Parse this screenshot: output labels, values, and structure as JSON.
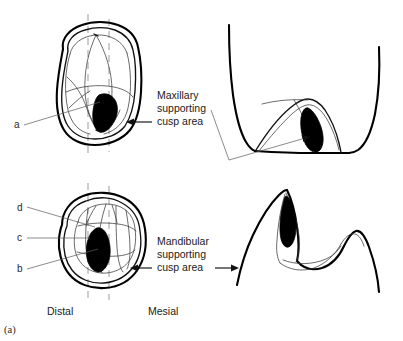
{
  "figure": {
    "caption": "(a)",
    "background_color": "#ffffff",
    "ink_color": "#000000"
  },
  "annotations": {
    "maxillary": {
      "line1": "Maxillary",
      "line2": "supporting",
      "line3": "cusp area"
    },
    "mandibular": {
      "line1": "Mandibular",
      "line2": "supporting",
      "line3": "cusp area"
    }
  },
  "orientation": {
    "left": "Distal",
    "right": "Mesial"
  },
  "callouts": [
    {
      "id": "a",
      "label": "a",
      "target": "maxillary-occlusal-cusp"
    },
    {
      "id": "d",
      "label": "d",
      "target": "mandibular-occlusal-ridge-outer"
    },
    {
      "id": "c",
      "label": "c",
      "target": "mandibular-occlusal-ridge-inner"
    },
    {
      "id": "b",
      "label": "b",
      "target": "mandibular-occlusal-cusp"
    }
  ],
  "panels": [
    {
      "id": "maxillary-occlusal",
      "name": "Maxillary occlusal view"
    },
    {
      "id": "maxillary-section",
      "name": "Maxillary cross-section view"
    },
    {
      "id": "mandibular-occlusal",
      "name": "Mandibular occlusal view"
    },
    {
      "id": "mandibular-section",
      "name": "Mandibular cross-section view"
    }
  ]
}
